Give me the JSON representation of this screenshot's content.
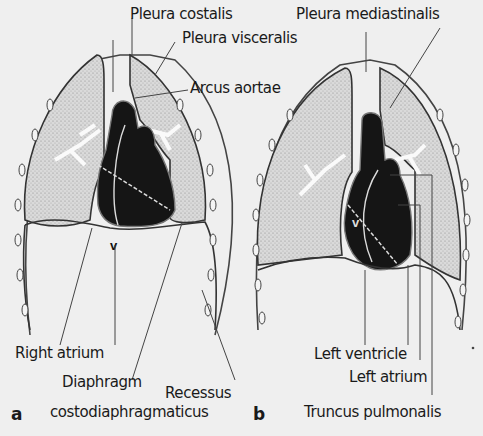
{
  "figure": {
    "panels": [
      {
        "id": "a",
        "label": "a",
        "labels": {
          "pleura_costalis": "Pleura costalis",
          "pleura_visceralis": "Pleura visceralis",
          "arcus_aortae": "Arcus aortae",
          "right_atrium": "Right atrium",
          "diaphragm": "Diaphragm",
          "recessus_line1": "Recessus",
          "recessus_line2": "costodiaphragmaticus"
        }
      },
      {
        "id": "b",
        "label": "b",
        "labels": {
          "pleura_mediastinalis": "Pleura mediastinalis",
          "left_ventricle": "Left ventricle",
          "left_atrium": "Left atrium",
          "truncus_pulmonalis": "Truncus pulmonalis"
        }
      }
    ],
    "heart_marker": "v",
    "colors": {
      "background": "#efefef",
      "lung_fill": "#d4d4d4",
      "heart_fill": "#151515",
      "outline": "#333333",
      "label_text": "#1a1a1a"
    }
  }
}
